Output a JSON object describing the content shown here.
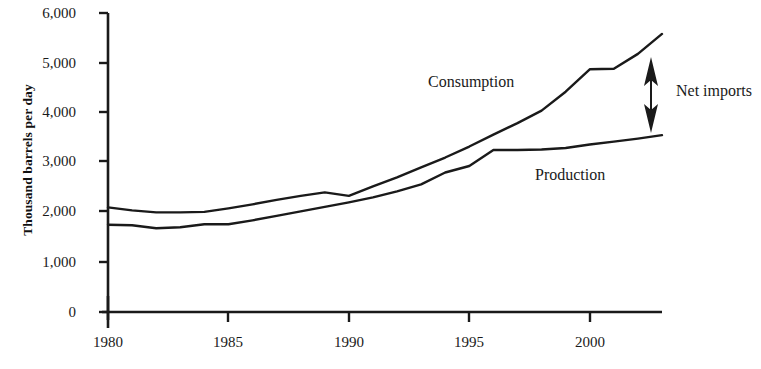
{
  "chart_data": {
    "type": "line",
    "title": "",
    "xlabel": "",
    "ylabel": "Thousand barrels per day",
    "xlim": [
      1980,
      2003
    ],
    "ylim": [
      0,
      6000
    ],
    "grid": false,
    "legend_position": "inline-annotations",
    "x_ticks": [
      "1980",
      "1985",
      "1990",
      "1995",
      "2000"
    ],
    "x_tick_values": [
      1980,
      1985,
      1990,
      1995,
      2000
    ],
    "y_ticks": [
      "0",
      "1,000",
      "2,000",
      "3,000",
      "4,000",
      "5,000",
      "6,000"
    ],
    "y_tick_values": [
      0,
      1000,
      2000,
      3000,
      4000,
      5000,
      6000
    ],
    "x": [
      1980,
      1981,
      1982,
      1983,
      1984,
      1985,
      1986,
      1987,
      1988,
      1989,
      1990,
      1991,
      1992,
      1993,
      1994,
      1995,
      1996,
      1997,
      1998,
      1999,
      2000,
      2001,
      2002,
      2003
    ],
    "series": [
      {
        "name": "Consumption",
        "values": [
          2100,
          2040,
          2000,
          2000,
          2010,
          2080,
          2160,
          2250,
          2330,
          2400,
          2330,
          2520,
          2700,
          2900,
          3100,
          3320,
          3560,
          3790,
          4040,
          4420,
          4870,
          4880,
          5180,
          5580
        ]
      },
      {
        "name": "Production",
        "values": [
          1750,
          1740,
          1680,
          1700,
          1760,
          1760,
          1840,
          1930,
          2020,
          2110,
          2200,
          2300,
          2420,
          2560,
          2800,
          2930,
          3250,
          3250,
          3260,
          3290,
          3360,
          3420,
          3480,
          3550
        ]
      }
    ],
    "annotations": [
      {
        "name": "net-imports",
        "label": "Net imports",
        "type": "double-arrow",
        "description": "Vertical double-headed arrow spanning the gap between Consumption and Production near 2003"
      }
    ],
    "colors": {
      "line": "#1a1a1a",
      "axis": "#1a1a1a",
      "background": "#ffffff"
    }
  },
  "labels": {
    "consumption": "Consumption",
    "production": "Production",
    "net_imports": "Net imports"
  }
}
